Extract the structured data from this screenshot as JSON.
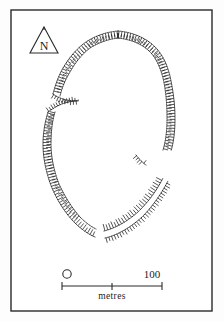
{
  "figure": {
    "kind": "archaeological-site-plan",
    "title": "",
    "background_color": "#ffffff",
    "ink_color": "#1c1c1c",
    "frame": {
      "stroke_color": "#2a2a2a",
      "x": 11,
      "y": 10,
      "width": 201,
      "height": 301
    }
  },
  "north_arrow": {
    "label": "N",
    "shape": "triangle",
    "x": 29,
    "y": 26,
    "width": 30,
    "height": 28
  },
  "scale_bar": {
    "start_label": "0",
    "end_label": "100",
    "units_label": "metres",
    "bar_x": 62,
    "bar_y": 285,
    "bar_width": 100,
    "ticks": [
      0,
      50,
      100
    ]
  },
  "plan_features": [
    {
      "name": "main-rampart-circuit",
      "description": "hachured enclosure rampart, oval plan",
      "style": "dotted-outline-with-hachures"
    },
    {
      "name": "west-entrance",
      "description": "inturned entrance gap on the north-west side"
    },
    {
      "name": "east-entrance",
      "description": "overlapping entrance gap on the east side"
    },
    {
      "name": "south-entrance",
      "description": "entrance gap on the south side"
    }
  ],
  "chart_data": {
    "type": "map",
    "title": "",
    "xlabel": "",
    "ylabel": "",
    "scale_metres_per_bar": 100,
    "annotations": [
      "N",
      "0",
      "100",
      "metres"
    ]
  }
}
